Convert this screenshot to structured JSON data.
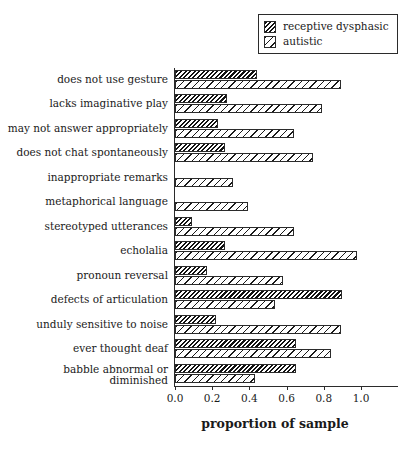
{
  "chart_data": {
    "type": "bar",
    "orientation": "horizontal",
    "title": "",
    "xlabel": "proportion of sample",
    "ylabel": "",
    "xlim": [
      0.0,
      1.0
    ],
    "xticks": [
      "0.0",
      "0.2",
      "0.4",
      "0.6",
      "0.8",
      "1.0"
    ],
    "xtick_values": [
      0.0,
      0.2,
      0.4,
      0.6,
      0.8,
      1.0
    ],
    "grid": false,
    "legend_position": "top-right",
    "categories": [
      "does not use gesture",
      "lacks imaginative play",
      "may not answer appropriately",
      "does not chat spontaneously",
      "inappropriate remarks",
      "metaphorical language",
      "stereotyped utterances",
      "echolalia",
      "pronoun reversal",
      "defects of articulation",
      "unduly sensitive to noise",
      "ever thought deaf",
      "babble abnormal or diminished"
    ],
    "series": [
      {
        "name": "receptive dysphasic",
        "pattern": "dense-dark-hatch",
        "values": [
          0.44,
          0.28,
          0.23,
          0.27,
          0.0,
          0.0,
          0.09,
          0.27,
          0.17,
          0.9,
          0.22,
          0.65,
          0.65
        ]
      },
      {
        "name": "autistic",
        "pattern": "sparse-light-hatch",
        "values": [
          0.89,
          0.79,
          0.64,
          0.74,
          0.31,
          0.39,
          0.64,
          0.98,
          0.58,
          0.54,
          0.89,
          0.84,
          0.43
        ]
      }
    ]
  },
  "legend": {
    "items": [
      {
        "label": "receptive dysphasic",
        "swatch": "dark-hatch-swatch"
      },
      {
        "label": "autistic",
        "swatch": "light-hatch-swatch"
      }
    ]
  }
}
